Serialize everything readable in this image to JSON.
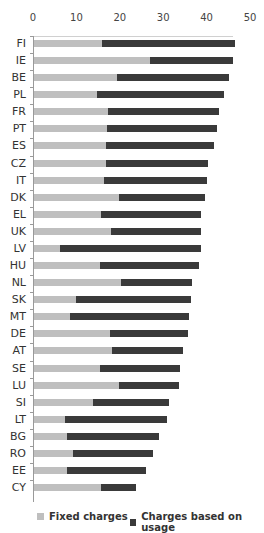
{
  "chart_data": {
    "type": "bar",
    "orientation": "horizontal",
    "stacked": true,
    "title": "",
    "xlabel": "",
    "ylabel": "",
    "xlim": [
      0,
      50
    ],
    "x_ticks": [
      0,
      10,
      20,
      30,
      40,
      50
    ],
    "x_axis_position": "top",
    "grid": false,
    "legend_position": "bottom",
    "categories": [
      "FI",
      "IE",
      "BE",
      "PL",
      "FR",
      "PT",
      "ES",
      "CZ",
      "IT",
      "DK",
      "EL",
      "UK",
      "LV",
      "HU",
      "NL",
      "SK",
      "MT",
      "DE",
      "AT",
      "SE",
      "LU",
      "SI",
      "LT",
      "BG",
      "RO",
      "EE",
      "CY"
    ],
    "series": [
      {
        "name": "Fixed charges",
        "color": "#bfbfbf",
        "values": [
          15.7,
          26.7,
          19.1,
          14.6,
          17.0,
          16.8,
          16.7,
          16.6,
          16.1,
          19.7,
          15.5,
          17.8,
          5.9,
          15.3,
          20.0,
          9.7,
          8.4,
          17.5,
          18.0,
          15.1,
          19.7,
          13.6,
          7.1,
          7.6,
          9.1,
          7.6,
          15.4
        ]
      },
      {
        "name": "Charges based on usage",
        "color": "#3a3a3a",
        "values": [
          30.6,
          19.2,
          25.8,
          29.2,
          25.7,
          25.3,
          24.7,
          23.5,
          23.8,
          19.6,
          22.9,
          20.6,
          32.5,
          22.7,
          16.3,
          26.5,
          27.4,
          17.9,
          16.3,
          18.5,
          13.6,
          17.4,
          23.5,
          21.3,
          18.4,
          18.3,
          8.1
        ]
      }
    ],
    "totals": [
      46.3,
      45.9,
      44.9,
      43.8,
      42.7,
      42.1,
      41.4,
      40.1,
      39.9,
      39.3,
      38.4,
      38.4,
      38.4,
      38.0,
      36.3,
      36.2,
      35.8,
      35.4,
      34.3,
      33.6,
      33.3,
      31.0,
      30.6,
      28.9,
      27.5,
      25.9,
      23.5
    ]
  },
  "legend": {
    "fixed_label": "Fixed charges",
    "usage_label": "Charges based on usage"
  }
}
